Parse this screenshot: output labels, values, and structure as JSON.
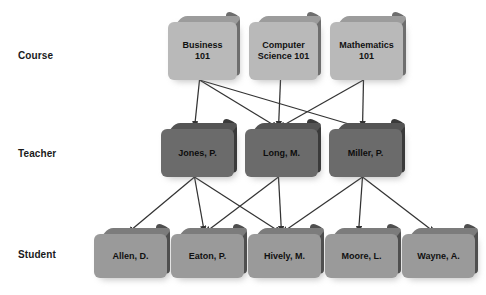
{
  "diagram": {
    "background_color": "#ffffff",
    "arrow_color": "#333333",
    "tiers": [
      {
        "key": "course",
        "label": "Course",
        "fill": "#b9b9b9",
        "bevel": "#6e6e6e"
      },
      {
        "key": "teacher",
        "label": "Teacher",
        "fill": "#6b6b6b",
        "bevel": "#3a3a3a"
      },
      {
        "key": "student",
        "label": "Student",
        "fill": "#9a9a9a",
        "bevel": "#4f4f4f"
      }
    ],
    "courses": [
      {
        "id": "c1",
        "line1": "Business",
        "line2": "101"
      },
      {
        "id": "c2",
        "line1": "Computer",
        "line2": "Science 101"
      },
      {
        "id": "c3",
        "line1": "Mathematics",
        "line2": "101"
      }
    ],
    "teachers": [
      {
        "id": "t1",
        "name": "Jones, P."
      },
      {
        "id": "t2",
        "name": "Long, M."
      },
      {
        "id": "t3",
        "name": "Miller, P."
      }
    ],
    "students": [
      {
        "id": "s1",
        "name": "Allen, D."
      },
      {
        "id": "s2",
        "name": "Eaton, P."
      },
      {
        "id": "s3",
        "name": "Hively, M."
      },
      {
        "id": "s4",
        "name": "Moore, L."
      },
      {
        "id": "s5",
        "name": "Wayne, A."
      }
    ],
    "links": [
      {
        "from": "c1",
        "to": "t1"
      },
      {
        "from": "c1",
        "to": "t2"
      },
      {
        "from": "c1",
        "to": "t3"
      },
      {
        "from": "c2",
        "to": "t2"
      },
      {
        "from": "c3",
        "to": "t2"
      },
      {
        "from": "c3",
        "to": "t3"
      },
      {
        "from": "t1",
        "to": "s1"
      },
      {
        "from": "t1",
        "to": "s2"
      },
      {
        "from": "t1",
        "to": "s3"
      },
      {
        "from": "t2",
        "to": "s2"
      },
      {
        "from": "t2",
        "to": "s3"
      },
      {
        "from": "t3",
        "to": "s3"
      },
      {
        "from": "t3",
        "to": "s4"
      },
      {
        "from": "t3",
        "to": "s5"
      }
    ]
  }
}
